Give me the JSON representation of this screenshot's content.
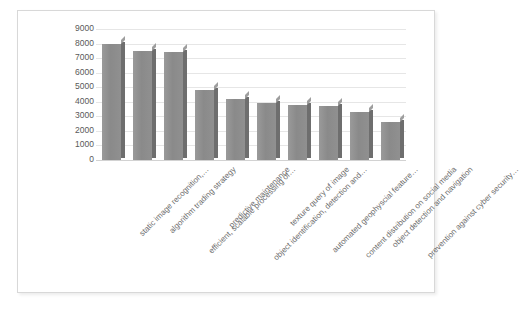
{
  "chart_data": {
    "type": "bar",
    "title": "",
    "subtitle": "",
    "xlabel": "",
    "ylabel": "",
    "ylim": [
      0,
      9000
    ],
    "ytick_step": 1000,
    "grid": true,
    "legend": false,
    "legend_position": "none",
    "style": "3d-column",
    "bar_color": "#8a8a8a",
    "bar_side_color": "#6e6e6e",
    "bar_top_color": "#9e9e9e",
    "gridline_color": "#e6e6e6",
    "tick_label_color": "#595959",
    "axis_label_color": "#6b6b6b",
    "categories": [
      "static image recognition,…",
      "algorithm trading strategy",
      "efficient, scalable processing of…",
      "predictive maintenance",
      "object identification, detection and…",
      "texture query of image",
      "automated geophyscial feature…",
      "content distribution on social media",
      "object detection and navigation",
      "prevention against cyber security…"
    ],
    "values": [
      8000,
      7500,
      7400,
      4800,
      4200,
      3900,
      3800,
      3700,
      3300,
      2600
    ],
    "ytick_labels": [
      "9000",
      "8000",
      "7000",
      "6000",
      "5000",
      "4000",
      "3000",
      "2000",
      "1000",
      "0"
    ],
    "ytick_values": [
      9000,
      8000,
      7000,
      6000,
      5000,
      4000,
      3000,
      2000,
      1000,
      0
    ]
  }
}
